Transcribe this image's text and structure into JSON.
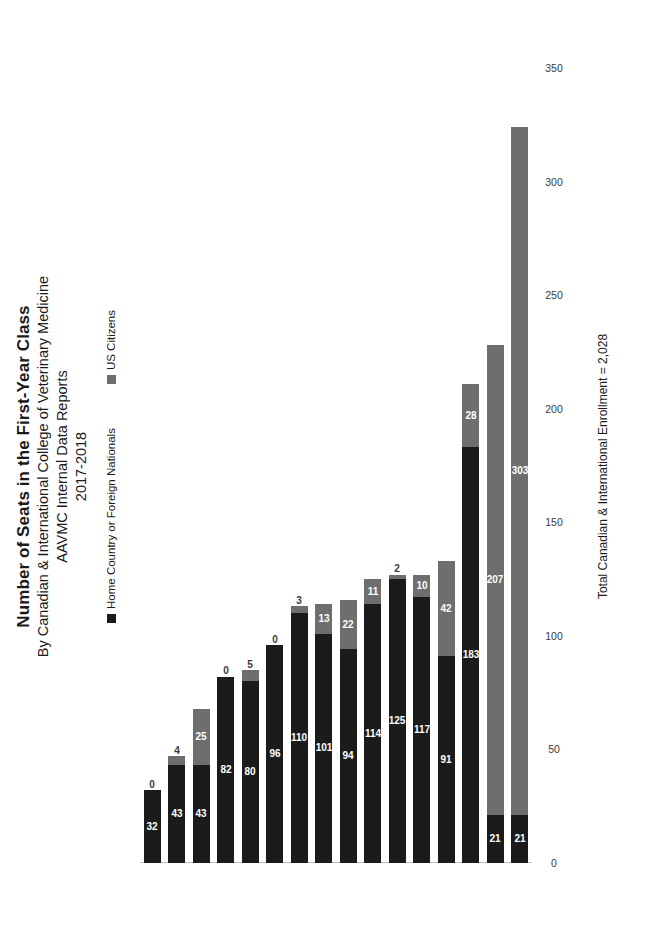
{
  "chart_data": {
    "type": "bar",
    "orientation": "horizontal",
    "title": "Number of Seats in the First-Year Class",
    "subtitle_lines": [
      "By Canadian & International College of Veterinary Medicine",
      "AAVMC Internal Data Reports",
      "2017-2018"
    ],
    "categories": [
      "RUSVM",
      "SGU",
      "UNOL",
      "UNOG",
      "UNOM",
      "UNQA",
      "MSSU",
      "UNCD",
      "ONT",
      "UNED",
      "MON",
      "UNOS",
      "SKW",
      "PEI",
      "MDU",
      "CLG"
    ],
    "series": [
      {
        "name": "Home Country or Foreign Nationals",
        "color": "#1b1b1b",
        "values": [
          21,
          21,
          183,
          91,
          117,
          125,
          114,
          94,
          101,
          110,
          96,
          80,
          82,
          43,
          43,
          32
        ]
      },
      {
        "name": "US Citizens",
        "color": "#6e6e6e",
        "values": [
          303,
          207,
          28,
          42,
          10,
          2,
          11,
          22,
          13,
          3,
          0,
          5,
          0,
          25,
          4,
          0
        ]
      }
    ],
    "stacked": true,
    "xlabel": "",
    "ylabel": "",
    "xlim": [
      0,
      350
    ],
    "xticks": [
      0,
      50,
      100,
      150,
      200,
      250,
      300,
      350
    ],
    "grid": false,
    "legend_position": "top",
    "annotation": "Total Canadian & International Enrollment = 2,028"
  },
  "legend": {
    "items": [
      {
        "label": "Home Country or Foreign Nationals",
        "color": "#1b1b1b"
      },
      {
        "label": "US Citizens",
        "color": "#6e6e6e"
      }
    ]
  }
}
